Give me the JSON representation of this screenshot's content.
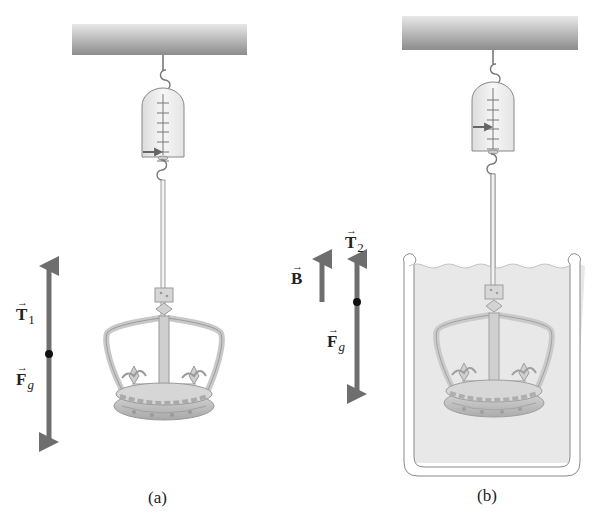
{
  "figure": {
    "panels": [
      {
        "id": "a",
        "caption": "(a)",
        "description": "Crown suspended in air from a spring scale",
        "scale_reading_tick": 6,
        "vectors": [
          {
            "symbol": "T",
            "subscript": "1",
            "direction": "up"
          },
          {
            "symbol": "F",
            "subscript": "g",
            "direction": "down"
          }
        ]
      },
      {
        "id": "b",
        "caption": "(b)",
        "description": "Crown submerged in water-filled beaker, suspended from a spring scale",
        "scale_reading_tick": 3,
        "vectors": [
          {
            "symbol": "B",
            "subscript": "",
            "direction": "up"
          },
          {
            "symbol": "T",
            "subscript": "2",
            "direction": "up"
          },
          {
            "symbol": "F",
            "subscript": "g",
            "direction": "down"
          }
        ]
      }
    ],
    "colors": {
      "arrow": "#6e6e6e",
      "ceiling_dark": "#8f8f8f",
      "ceiling_light": "#e3e3e3",
      "water": "#e6e6e6",
      "crown": "#bdbdbd",
      "scale_body": "#f3f3f3"
    }
  }
}
